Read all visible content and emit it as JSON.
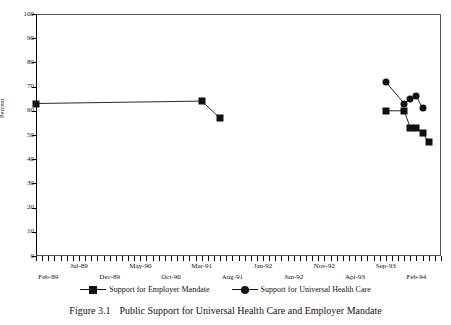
{
  "caption": {
    "figure_number": "Figure 3.1",
    "text": "Public Support for Universal Health Care and Employer Mandate"
  },
  "legend": {
    "entries": [
      {
        "label": "Support for Employer Mandate",
        "marker": "square",
        "color": "#111111"
      },
      {
        "label": "Support for Universal Health Care",
        "marker": "circle",
        "color": "#111111"
      }
    ]
  },
  "chart_data": {
    "type": "line",
    "title": "Public Support for Universal Health Care and Employer Mandate",
    "xlabel": "",
    "ylabel": "Percent",
    "ylim": [
      0,
      100
    ],
    "ytick_step": 10,
    "yticks": [
      0,
      10,
      20,
      30,
      40,
      50,
      60,
      70,
      80,
      90,
      100
    ],
    "grid": false,
    "legend_position": "bottom",
    "x_axis": {
      "type": "month-index",
      "tick_interval_months": 1,
      "range": [
        "Dec-88",
        "Jun-94"
      ],
      "labels_row_upper": [
        "Jul-89",
        "May-90",
        "Mar-91",
        "Jan-92",
        "Nov-92",
        "Sep-93"
      ],
      "labels_row_lower": [
        "Feb-89",
        "Dec-89",
        "Oct-90",
        "Aug-91",
        "Jun-92",
        "Apr-93",
        "Feb-94"
      ]
    },
    "series": [
      {
        "name": "Support for Employer Mandate",
        "marker": "square",
        "color": "#111111",
        "points": [
          {
            "x": "Dec-88",
            "y": 63
          },
          {
            "x": "Mar-91",
            "y": 64
          },
          {
            "x": "Jun-91",
            "y": 57
          }
        ],
        "points_segment_2": [
          {
            "x": "Sep-93",
            "y": 60
          },
          {
            "x": "Dec-93",
            "y": 60
          },
          {
            "x": "Jan-94",
            "y": 53
          },
          {
            "x": "Feb-94",
            "y": 53
          },
          {
            "x": "Mar-94",
            "y": 51
          },
          {
            "x": "Apr-94",
            "y": 47
          }
        ]
      },
      {
        "name": "Support for Universal Health Care",
        "marker": "circle",
        "color": "#111111",
        "points": [
          {
            "x": "Sep-93",
            "y": 72
          },
          {
            "x": "Dec-93",
            "y": 63
          },
          {
            "x": "Jan-94",
            "y": 65
          },
          {
            "x": "Feb-94",
            "y": 66
          },
          {
            "x": "Mar-94",
            "y": 61
          }
        ]
      }
    ]
  }
}
